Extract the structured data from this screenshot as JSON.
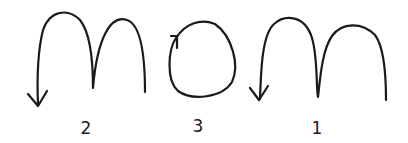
{
  "diagram": {
    "stroke_color": "#1a1a1a",
    "background": "#ffffff",
    "glyphs": [
      {
        "id": "m-left",
        "letter": "m",
        "order_label": "2",
        "arrow": "down-left at end of left leg"
      },
      {
        "id": "o-middle",
        "letter": "o",
        "order_label": "3",
        "arrow": "clockwise start at top-left"
      },
      {
        "id": "m-right",
        "letter": "m",
        "order_label": "1",
        "arrow": "down-left at end of left leg"
      }
    ]
  }
}
